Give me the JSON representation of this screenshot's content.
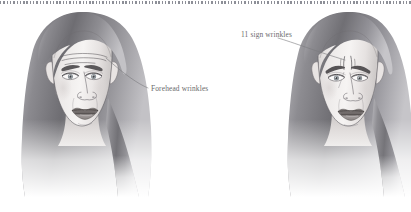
{
  "figure": {
    "background_color": "#ffffff",
    "width": 411,
    "height": 212,
    "top_rule": {
      "name": "dotted-rule",
      "style": "dotted",
      "color": "#8d8f97"
    }
  },
  "annotations": [
    {
      "id": "forehead",
      "label": "Forehead wrinkles",
      "text_color": "#6a6a6c",
      "target": "left-face-forehead",
      "leader_line_color": "#7a7a7e"
    },
    {
      "id": "eleven",
      "label": "11 sign wrinkles",
      "text_color": "#6a6a6c",
      "target": "right-face-glabella",
      "leader_line_color": "#7a7a7e"
    }
  ],
  "figures": [
    {
      "id": "left-face",
      "name": "female-face-front-view-left",
      "condition": "Forehead wrinkles",
      "wrinkle_type": "horizontal-forehead-lines",
      "wrinkle_count": 3
    },
    {
      "id": "right-face",
      "name": "female-face-front-view-right",
      "condition": "11 sign wrinkles",
      "wrinkle_type": "vertical-glabellar-lines",
      "wrinkle_count": 2
    }
  ],
  "palette": {
    "skin_light": "#f3f1f0",
    "skin_mid": "#e2dedd",
    "skin_shadow": "#c9c5c4",
    "hair_dark": "#6f6e72",
    "hair_mid": "#9d9ca0",
    "hair_light": "#d6d5d8",
    "outline": "#4a4a4d",
    "lip": "#8f8a89",
    "lip_dark": "#6b6665",
    "iris": "#9aa2a8",
    "brow": "#5b585a",
    "text": "#6a6a6c"
  }
}
